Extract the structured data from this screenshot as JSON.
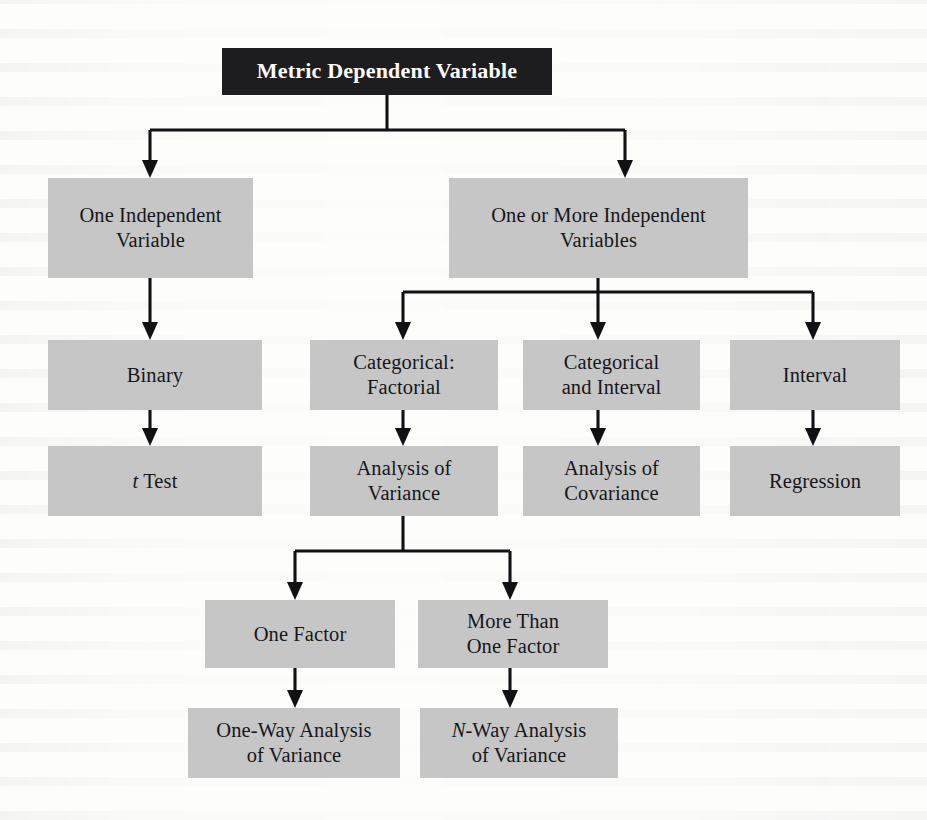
{
  "diagram": {
    "title_box": {
      "label": "Metric Dependent Variable",
      "fill": "#1d1d1f",
      "text_color": "#ffffff"
    },
    "node_fill": "#c6c6c6",
    "node_text_color": "#16161a",
    "connector_color": "#111114",
    "nodes": [
      {
        "id": "root",
        "label": "Metric Dependent Variable"
      },
      {
        "id": "one-iv",
        "line1": "One Independent",
        "line2": "Variable"
      },
      {
        "id": "more-iv",
        "line1": "One or More Independent",
        "line2": "Variables"
      },
      {
        "id": "binary",
        "line1": "Binary",
        "line2": ""
      },
      {
        "id": "cat-fact",
        "line1": "Categorical:",
        "line2": "Factorial"
      },
      {
        "id": "cat-int",
        "line1": "Categorical",
        "line2": "and Interval"
      },
      {
        "id": "interval",
        "line1": "Interval",
        "line2": ""
      },
      {
        "id": "t-test",
        "italic": "t",
        "rest": " Test"
      },
      {
        "id": "anova",
        "line1": "Analysis of",
        "line2": "Variance"
      },
      {
        "id": "ancova",
        "line1": "Analysis of",
        "line2": "Covariance"
      },
      {
        "id": "regression",
        "line1": "Regression",
        "line2": ""
      },
      {
        "id": "one-factor",
        "line1": "One Factor",
        "line2": ""
      },
      {
        "id": "more-factor",
        "line1": "More Than",
        "line2": "One Factor"
      },
      {
        "id": "one-way",
        "line1": "One-Way Analysis",
        "line2": "of Variance"
      },
      {
        "id": "n-way",
        "italic": "N",
        "rest": "-Way Analysis",
        "line2": "of Variance"
      }
    ],
    "edges": [
      {
        "from": "root",
        "to": "one-iv"
      },
      {
        "from": "root",
        "to": "more-iv"
      },
      {
        "from": "one-iv",
        "to": "binary"
      },
      {
        "from": "more-iv",
        "to": "cat-fact"
      },
      {
        "from": "more-iv",
        "to": "cat-int"
      },
      {
        "from": "more-iv",
        "to": "interval"
      },
      {
        "from": "binary",
        "to": "t-test"
      },
      {
        "from": "cat-fact",
        "to": "anova"
      },
      {
        "from": "cat-int",
        "to": "ancova"
      },
      {
        "from": "interval",
        "to": "regression"
      },
      {
        "from": "anova",
        "to": "one-factor"
      },
      {
        "from": "anova",
        "to": "more-factor"
      },
      {
        "from": "one-factor",
        "to": "one-way"
      },
      {
        "from": "more-factor",
        "to": "n-way"
      }
    ]
  }
}
